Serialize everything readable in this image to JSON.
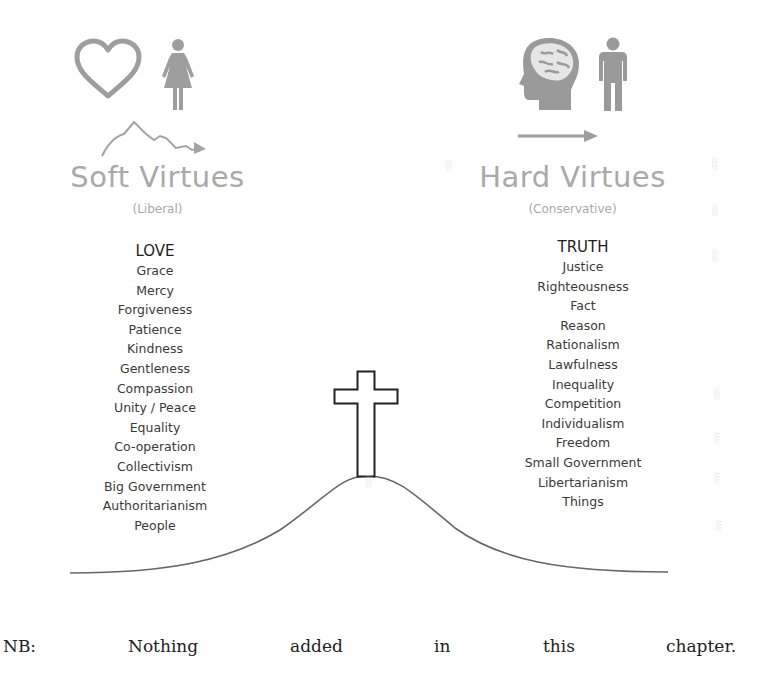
{
  "left_side": {
    "title": "Soft Virtues",
    "subtitle": "(Liberal)",
    "icons": [
      "heart-icon",
      "woman-icon",
      "wavy-arrow-icon"
    ],
    "heading": "LOVE",
    "items": [
      "Grace",
      "Mercy",
      "Forgiveness",
      "Patience",
      "Kindness",
      "Gentleness",
      "Compassion",
      "Unity / Peace",
      "Equality",
      "Co-operation",
      "Collectivism",
      "Big Government",
      "Authoritarianism",
      "People"
    ]
  },
  "right_side": {
    "title": "Hard Virtues",
    "subtitle": "(Conservative)",
    "icons": [
      "brain-head-icon",
      "man-icon",
      "straight-arrow-icon"
    ],
    "heading": "TRUTH",
    "items": [
      "Justice",
      "Righteousness",
      "Fact",
      "Reason",
      "Rationalism",
      "Lawfulness",
      "Inequality",
      "Competition",
      "Individualism",
      "Freedom",
      "Small Government",
      "Libertarianism",
      "Things"
    ]
  },
  "center": {
    "icons": [
      "cross-icon",
      "hill-curve"
    ]
  },
  "footnote": {
    "words": [
      "NB:",
      "Nothing",
      "added",
      "in",
      "this",
      "chapter."
    ]
  },
  "colors": {
    "icon_gray": "#9e9e9e",
    "title_gray": "#a9a9a9",
    "text_dark": "#3a3a3a",
    "line": "#555555"
  }
}
